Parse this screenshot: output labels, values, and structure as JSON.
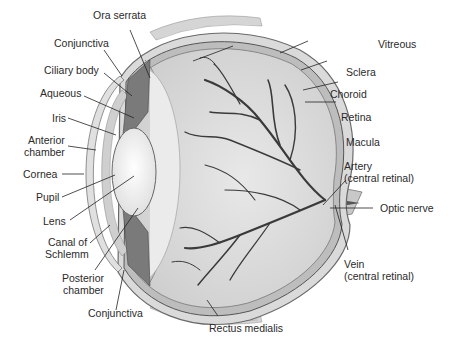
{
  "figure": {
    "colors": {
      "background": "#ffffff",
      "sclera": "#d9d9d9",
      "vitreous": "#dcdcdc",
      "vessels": "#3a3a3a",
      "ciliary": "#7a7a7a",
      "lens": "#f2f2f2",
      "label_text": "#2a2a2a",
      "leader_line": "#222222"
    }
  },
  "labels": {
    "left": [
      {
        "id": "ora_serrata",
        "text": "Ora serrata"
      },
      {
        "id": "conjunctiva_top",
        "text": "Conjunctiva"
      },
      {
        "id": "ciliary_body",
        "text": "Ciliary body"
      },
      {
        "id": "aqueous",
        "text": "Aqueous"
      },
      {
        "id": "iris",
        "text": "Iris"
      },
      {
        "id": "anterior_chamber_1",
        "text": "Anterior"
      },
      {
        "id": "anterior_chamber_2",
        "text": "chamber"
      },
      {
        "id": "cornea",
        "text": "Cornea"
      },
      {
        "id": "pupil",
        "text": "Pupil"
      },
      {
        "id": "lens",
        "text": "Lens"
      },
      {
        "id": "canal_1",
        "text": "Canal of"
      },
      {
        "id": "canal_2",
        "text": "Schlemm"
      },
      {
        "id": "posterior_1",
        "text": "Posterior"
      },
      {
        "id": "posterior_2",
        "text": "chamber"
      },
      {
        "id": "conjunctiva_bottom",
        "text": "Conjunctiva"
      }
    ],
    "right": [
      {
        "id": "vitreous",
        "text": "Vitreous"
      },
      {
        "id": "sclera",
        "text": "Sclera"
      },
      {
        "id": "choroid",
        "text": "Choroid"
      },
      {
        "id": "retina",
        "text": "Retina"
      },
      {
        "id": "macula",
        "text": "Macula"
      },
      {
        "id": "artery_1",
        "text": "Artery"
      },
      {
        "id": "artery_2",
        "text": "(central retinal)"
      },
      {
        "id": "optic_nerve",
        "text": "Optic nerve"
      },
      {
        "id": "vein_1",
        "text": "Vein"
      },
      {
        "id": "vein_2",
        "text": "(central retinal)"
      }
    ],
    "bottom": [
      {
        "id": "rectus_medialis",
        "text": "Rectus medialis"
      }
    ]
  }
}
